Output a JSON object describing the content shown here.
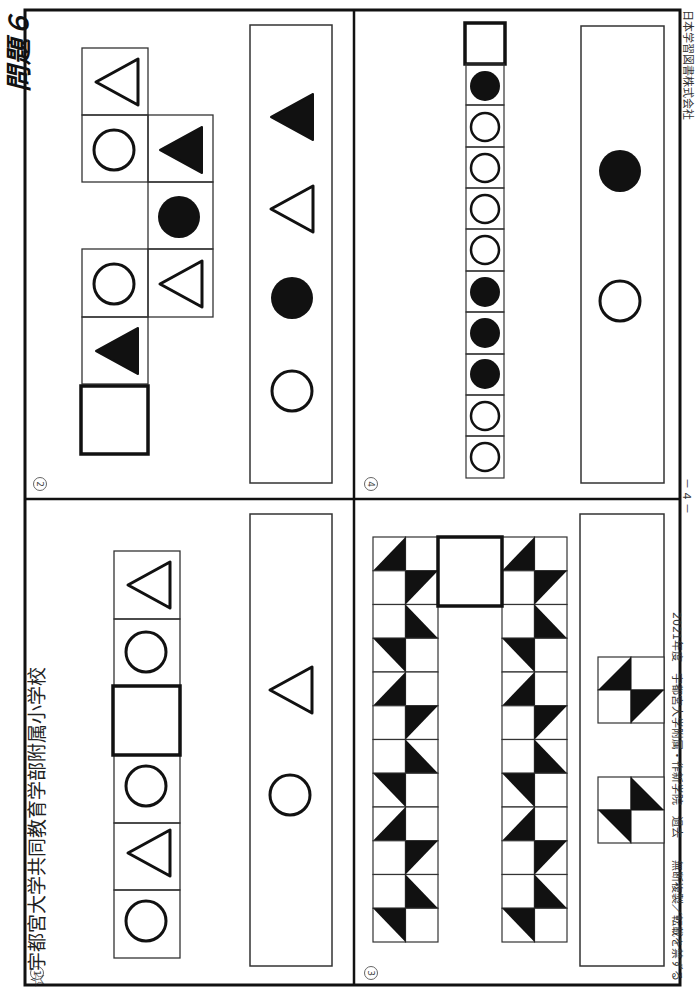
{
  "header": {
    "school_title": "☆宇都宮大学共同教育学部附属小学校",
    "problem_label": "問題６"
  },
  "footer": {
    "left": "2021年度　宇都宮大学附属・作新学院　過去　　無断複製／転載を禁ずる",
    "page_number": "－ 4 －",
    "publisher": "日本学習図書株式会社"
  },
  "panels": [
    {
      "number": "①",
      "sequence": [
        "circle-outline",
        "triangle-outline",
        "circle-outline",
        "blank",
        "circle-outline",
        "triangle-outline"
      ],
      "answer_choices": [
        "circle-outline",
        "triangle-outline"
      ]
    },
    {
      "number": "②",
      "grid_shapes": [
        "triangle-filled",
        "circle-outline",
        "triangle-outline",
        "circle-filled",
        "triangle-filled",
        "circle-outline",
        "triangle-outline",
        "blank"
      ],
      "answer_choices": [
        "circle-outline",
        "circle-filled",
        "triangle-outline",
        "triangle-filled"
      ]
    },
    {
      "number": "③",
      "description": "Two columns of 12 half-shaded tile rows with a blank square on top",
      "answer_choices": [
        "tile-pattern-a",
        "tile-pattern-b"
      ]
    },
    {
      "number": "④",
      "sequence": [
        "circle-outline",
        "circle-outline",
        "circle-filled",
        "circle-filled",
        "circle-filled",
        "circle-outline",
        "circle-outline",
        "circle-outline",
        "circle-outline",
        "circle-filled",
        "blank"
      ],
      "answer_choices": [
        "circle-outline",
        "circle-filled"
      ]
    }
  ],
  "colors": {
    "ink": "#111111",
    "paper": "#ffffff",
    "thin_line": "#444444"
  }
}
